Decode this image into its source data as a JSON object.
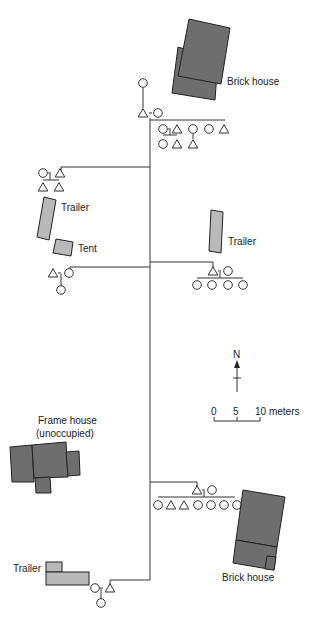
{
  "labels": {
    "brick_house_top": "Brick house",
    "trailer_left": "Trailer",
    "tent": "Tent",
    "trailer_right": "Trailer",
    "frame_house_line1": "Frame house",
    "frame_house_line2": "(unoccupied)",
    "brick_house_bottom": "Brick house",
    "trailer_bottom": "Trailer"
  },
  "compass": {
    "north_label": "N"
  },
  "scale": {
    "ticks": [
      "0",
      "5",
      "10 meters"
    ]
  },
  "colors": {
    "building_dark": "#6e6e6e",
    "building_light": "#b9b9b9",
    "line": "#333333"
  },
  "kinship_groups": [
    {
      "location": "top",
      "parents": [
        "female-parent",
        "male",
        "female"
      ],
      "children": [
        "female",
        "male",
        "female",
        "male"
      ],
      "grandchildren": [
        "female",
        "male",
        "male"
      ]
    },
    {
      "location": "upper-left",
      "parents": [
        "female",
        "male"
      ],
      "children": [
        "male",
        "male"
      ]
    },
    {
      "location": "middle-left",
      "parents": [
        "male",
        "female"
      ],
      "children": [
        "female"
      ]
    },
    {
      "location": "middle-right",
      "parents": [
        "male",
        "female"
      ],
      "children": [
        "female",
        "female",
        "female",
        "female"
      ]
    },
    {
      "location": "lower-right",
      "parents": [
        "male",
        "female"
      ],
      "children": [
        "female",
        "male",
        "male",
        "female",
        "female",
        "female",
        "female"
      ]
    },
    {
      "location": "bottom",
      "parents": [
        "female",
        "male"
      ],
      "children": [
        "female"
      ]
    }
  ]
}
